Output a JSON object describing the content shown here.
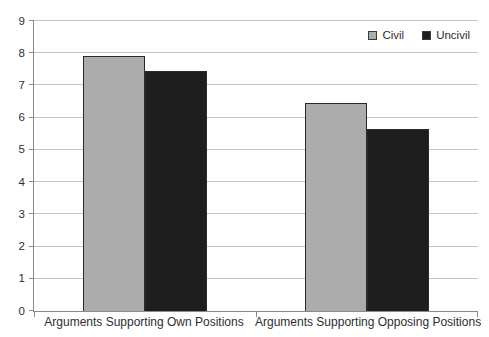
{
  "chart_data": {
    "type": "bar",
    "title": "",
    "categories": [
      "Arguments Supporting Own Positions",
      "Arguments Supporting Opposing Positions"
    ],
    "series": [
      {
        "name": "Civil",
        "color": "#acacac",
        "values": [
          7.9,
          6.45
        ]
      },
      {
        "name": "Uncivil",
        "color": "#1e1e1e",
        "values": [
          7.45,
          5.65
        ]
      }
    ],
    "ylim": [
      0,
      9
    ],
    "ytick_labels": [
      "0",
      "1",
      "2",
      "3",
      "4",
      "5",
      "6",
      "7",
      "8",
      "9"
    ],
    "xlabel": "",
    "ylabel": "",
    "grid": "horizontal",
    "legend_position": "top-right",
    "colors": {
      "gridline": "#c4c4c4",
      "axis": "#8a8a8a",
      "bar_border": "#2a2a2a",
      "text": "#2e2e2e",
      "background": "#ffffff"
    }
  }
}
